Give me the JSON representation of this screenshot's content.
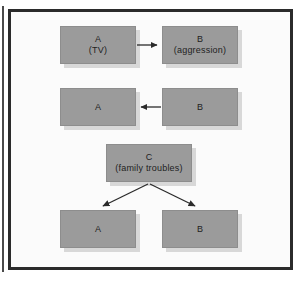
{
  "figure": {
    "nodes": [
      {
        "id": "a-tv",
        "label": "A",
        "sublabel": "(TV)"
      },
      {
        "id": "b-agg",
        "label": "B",
        "sublabel": "(aggression)"
      },
      {
        "id": "a-mid",
        "label": "A",
        "sublabel": ""
      },
      {
        "id": "b-mid",
        "label": "B",
        "sublabel": ""
      },
      {
        "id": "c-family",
        "label": "C",
        "sublabel": "(family troubles)"
      },
      {
        "id": "a-bottom",
        "label": "A",
        "sublabel": ""
      },
      {
        "id": "b-bottom",
        "label": "B",
        "sublabel": ""
      }
    ],
    "arrows": [
      {
        "id": "a-to-b",
        "from": "a-tv",
        "to": "b-agg",
        "direction": "right"
      },
      {
        "id": "b-to-a",
        "from": "b-mid",
        "to": "a-mid",
        "direction": "left"
      },
      {
        "id": "c-to-a-bottom",
        "from": "c-family",
        "to": "a-bottom",
        "direction": "down-left"
      },
      {
        "id": "c-to-b-bottom",
        "from": "c-family",
        "to": "b-bottom",
        "direction": "down-right"
      }
    ],
    "colors": {
      "box_fill": "#9b9b9b",
      "box_shadow": "#d8d8d8",
      "frame_border": "#2b2b2b",
      "arrow": "#2b2b2b",
      "background": "#fbfbfb",
      "text": "#1e1e1e"
    }
  }
}
